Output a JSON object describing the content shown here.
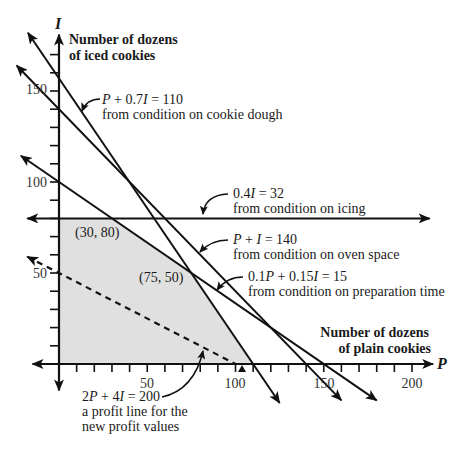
{
  "figure": {
    "y_axis": {
      "symbol": "I",
      "title_lines": [
        "Number of dozens",
        "of iced cookies"
      ],
      "tick_labels": [
        "150",
        "100",
        "50"
      ]
    },
    "x_axis": {
      "symbol": "P",
      "title_lines": [
        "Number of dozens",
        "of plain cookies"
      ],
      "tick_labels": [
        "50",
        "100",
        "150",
        "200"
      ]
    },
    "annotations": {
      "dough": {
        "equation": "P + 0.7I = 110",
        "note": "from condition on cookie dough"
      },
      "icing": {
        "equation": "0.4I = 32",
        "note": "from condition on icing"
      },
      "oven": {
        "equation": "P + I = 140",
        "note": "from condition on oven space"
      },
      "prep": {
        "equation": "0.1P + 0.15I = 15",
        "note": "from condition on preparation time"
      },
      "profit": {
        "equation": "2P + 4I = 200",
        "note_lines": [
          "a profit line for the",
          "new profit values"
        ]
      }
    },
    "vertex_labels": [
      "(30, 80)",
      "(75, 50)"
    ],
    "colors": {
      "ink": "#111111",
      "feasible_fill": "#e0e0e0"
    }
  },
  "chart_data": {
    "type": "line",
    "title": "",
    "xlabel": "Number of dozens of plain cookies (P)",
    "ylabel": "Number of dozens of iced cookies (I)",
    "xlim": [
      -15,
      212
    ],
    "ylim": [
      -14.5,
      181
    ],
    "grid": false,
    "legend": "none (lines labeled inline)",
    "x_ticks": {
      "step": 10,
      "from": 10,
      "to": 200,
      "labeled": [
        50,
        100,
        150,
        200
      ]
    },
    "y_ticks": {
      "step": 10,
      "from": 10,
      "to": 170,
      "labeled": [
        50,
        100,
        150
      ]
    },
    "series": [
      {
        "name": "cookie dough",
        "equation": "P + 0.7I = 110",
        "style": "solid",
        "arrows": "both",
        "points": [
          [
            -17.6,
            182
          ],
          [
            125,
            -21.4
          ]
        ]
      },
      {
        "name": "oven space",
        "equation": "P + I = 140",
        "style": "solid",
        "arrows": "both",
        "points": [
          [
            -24,
            164
          ],
          [
            160,
            -20
          ]
        ]
      },
      {
        "name": "preparation time",
        "equation": "0.1P + 0.15I = 15",
        "style": "solid",
        "arrows": "both",
        "points": [
          [
            -21.6,
            114.4
          ],
          [
            180,
            -20
          ]
        ]
      },
      {
        "name": "icing",
        "equation": "0.4I = 32",
        "style": "solid",
        "arrows": "both",
        "points": [
          [
            -18,
            80
          ],
          [
            210,
            80
          ]
        ]
      },
      {
        "name": "profit line",
        "equation": "2P + 4I = 200",
        "style": "dashed",
        "arrows": "start",
        "points": [
          [
            -18,
            59
          ],
          [
            100,
            0
          ]
        ]
      }
    ],
    "feasible_region": {
      "vertices": [
        [
          0,
          0
        ],
        [
          0,
          80
        ],
        [
          30,
          80
        ],
        [
          75,
          50
        ],
        [
          110,
          0
        ]
      ]
    },
    "vertex_points": [
      {
        "point": [
          30,
          80
        ],
        "label": "(30, 80)"
      },
      {
        "point": [
          75,
          50
        ],
        "label": "(75, 50)"
      }
    ]
  }
}
